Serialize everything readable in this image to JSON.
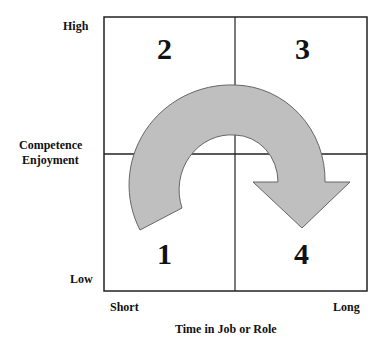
{
  "y_axis": {
    "high": "High",
    "title_line1": "Competence",
    "title_line2": "Enjoyment",
    "low": "Low"
  },
  "x_axis": {
    "short": "Short",
    "long": "Long",
    "title": "Time in Job or Role"
  },
  "quadrants": [
    {
      "id": "top-left",
      "label": "2"
    },
    {
      "id": "top-right",
      "label": "3"
    },
    {
      "id": "bottom-left",
      "label": "1"
    },
    {
      "id": "bottom-right",
      "label": "4"
    }
  ],
  "arrow": {
    "color": "#bfbfbf",
    "direction": "clockwise 1→2→3→4"
  }
}
